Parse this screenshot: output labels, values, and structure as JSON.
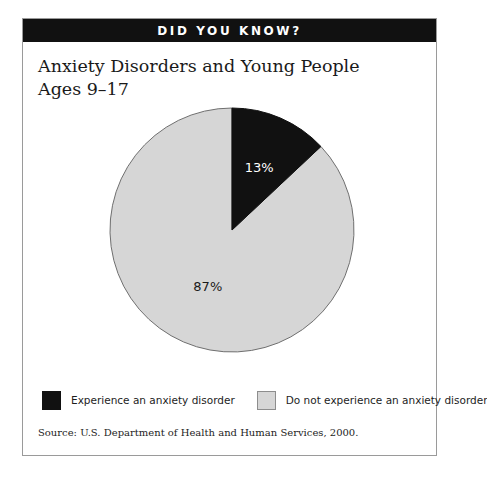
{
  "banner": {
    "label": "DID YOU KNOW?"
  },
  "title": {
    "line1": "Anxiety Disorders and Young People",
    "line2": "Ages 9–17"
  },
  "legend": {
    "items": [
      {
        "label": "Experience an anxiety disorder",
        "color": "#111111",
        "swatch": "black"
      },
      {
        "label": "Do not experience an anxiety disorder",
        "color": "#d6d6d6",
        "swatch": "gray"
      }
    ]
  },
  "source": {
    "text": "Source:  U.S. Department of Health and Human Services, 2000."
  },
  "chart_data": {
    "type": "pie",
    "title": "Anxiety Disorders and Young People Ages 9–17",
    "subtitle": "",
    "xlabel": "",
    "ylabel": "",
    "grid": false,
    "legend_position": "bottom",
    "start_angle_deg": 0,
    "direction": "clockwise",
    "unit": "percent",
    "categories": [
      "Experience an anxiety disorder",
      "Do not experience an anxiety disorder"
    ],
    "values": [
      13,
      87
    ],
    "labels": [
      "13%",
      "87%"
    ],
    "colors": [
      "#111111",
      "#d6d6d6"
    ],
    "label_colors": [
      "#ffffff",
      "#1a1a1a"
    ],
    "slices": [
      {
        "name": "Experience an anxiety disorder",
        "value": 13,
        "label": "13%",
        "color": "#111111",
        "label_color": "#ffffff"
      },
      {
        "name": "Do not experience an anxiety disorder",
        "value": 87,
        "label": "87%",
        "color": "#d6d6d6",
        "label_color": "#1a1a1a"
      }
    ],
    "annotations": [
      "Source:  U.S. Department of Health and Human Services, 2000."
    ]
  }
}
